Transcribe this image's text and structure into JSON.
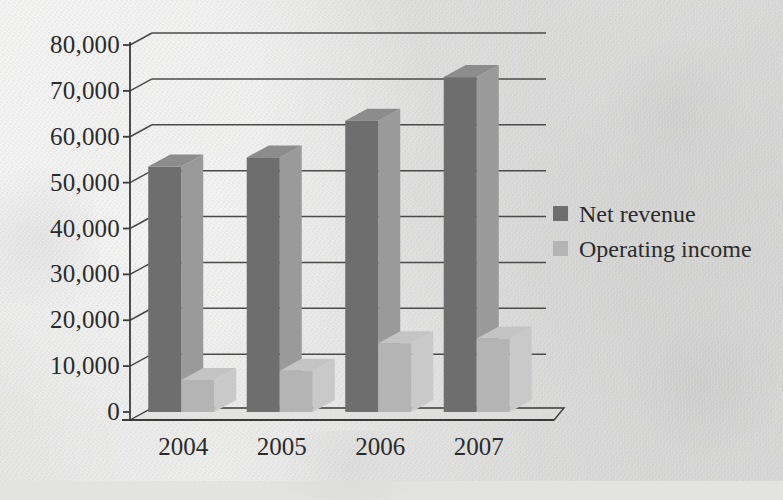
{
  "chart_data": {
    "type": "bar",
    "title": "",
    "xlabel": "",
    "ylabel": "",
    "categories": [
      "2004",
      "2005",
      "2006",
      "2007"
    ],
    "series": [
      {
        "name": "Net revenue",
        "color": "#6e6e6e",
        "values": [
          53500,
          55500,
          63500,
          73000
        ]
      },
      {
        "name": "Operating income",
        "color": "#b4b4b4",
        "values": [
          7000,
          9000,
          15000,
          16000
        ]
      }
    ],
    "ylim": [
      0,
      80000
    ],
    "ytick_step": 10000,
    "ytick_labels": [
      "80,000",
      "70,000",
      "60,000",
      "50,000",
      "40,000",
      "30,000",
      "20,000",
      "10,000",
      "0"
    ],
    "ytick_values": [
      80000,
      70000,
      60000,
      50000,
      40000,
      30000,
      20000,
      10000,
      0
    ],
    "grid": true,
    "grid_axis": "y",
    "legend_position": "right",
    "style_3d": true
  },
  "legend": {
    "items": [
      {
        "label": "Net revenue",
        "swatch_color": "#6e6e6e"
      },
      {
        "label": "Operating income",
        "swatch_color": "#b4b4b4"
      }
    ]
  },
  "colors": {
    "background": "#e3e3e2",
    "axis": "#3a3a3a",
    "grid": "#4a4a4a",
    "text": "#2b2b2b",
    "series_net_revenue": "#6e6e6e",
    "series_net_revenue_side": "#9a9a9a",
    "series_net_revenue_top": "#8c8c8c",
    "series_operating_income": "#b4b4b4",
    "series_operating_income_side": "#c9c9c9",
    "series_operating_income_top": "#c4c4c4"
  }
}
